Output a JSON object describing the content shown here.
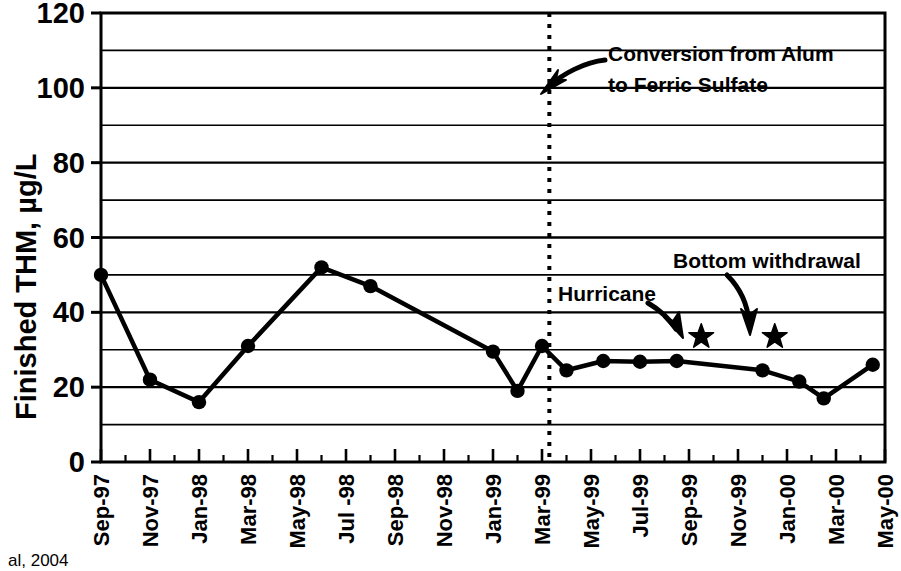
{
  "chart_data": {
    "type": "line",
    "title": "",
    "xlabel": "",
    "ylabel": "Finished THM, µg/L",
    "ylim": [
      0,
      120
    ],
    "y_ticks": [
      0,
      20,
      40,
      60,
      80,
      100,
      120
    ],
    "y_tick_labels": [
      "0",
      "20",
      "40",
      "60",
      "80",
      "100",
      "120"
    ],
    "y_minor_gridlines": [
      10,
      30,
      50,
      70,
      90,
      110
    ],
    "grid": true,
    "legend": "none",
    "x_tick_labels": [
      "Sep-97",
      "Nov-97",
      "Jan-98",
      "Mar-98",
      "May-98",
      "Jul -98",
      "Sep-98",
      "Nov-98",
      "Jan-99",
      "Mar-99",
      "May-99",
      "Jul-99",
      "Sep-99",
      "Nov-99",
      "Jan-00",
      "Mar-00",
      "May-00"
    ],
    "x_tick_months": [
      0,
      2,
      4,
      6,
      8,
      10,
      12,
      14,
      16,
      18,
      20,
      22,
      24,
      26,
      28,
      30,
      32
    ],
    "x_range_months": [
      0,
      32
    ],
    "series": [
      {
        "name": "Finished THM",
        "marker": "filled-circle",
        "points": [
          {
            "x_month": 0,
            "x_label": "Sep-97",
            "y": 50
          },
          {
            "x_month": 2,
            "x_label": "Nov-97",
            "y": 22
          },
          {
            "x_month": 4,
            "x_label": "Jan-98",
            "y": 16
          },
          {
            "x_month": 6,
            "x_label": "Mar-98",
            "y": 31
          },
          {
            "x_month": 9,
            "x_label": "Jun-98",
            "y": 52
          },
          {
            "x_month": 11,
            "x_label": "Aug-98",
            "y": 47
          },
          {
            "x_month": 16,
            "x_label": "Jan-99",
            "y": 29.5
          },
          {
            "x_month": 17,
            "x_label": "Feb-99",
            "y": 19
          },
          {
            "x_month": 18,
            "x_label": "Mar-99",
            "y": 31
          },
          {
            "x_month": 19,
            "x_label": "Apr-99",
            "y": 24.5
          },
          {
            "x_month": 20.5,
            "x_label": "May-99",
            "y": 27
          },
          {
            "x_month": 22,
            "x_label": "Jul-99",
            "y": 26.8
          },
          {
            "x_month": 23.5,
            "x_label": "Aug-99",
            "y": 27
          },
          {
            "x_month": 27,
            "x_label": "Dec-99",
            "y": 24.5
          },
          {
            "x_month": 28.5,
            "x_label": "Jan-00",
            "y": 21.5
          },
          {
            "x_month": 29.5,
            "x_label": "Feb-00",
            "y": 17
          },
          {
            "x_month": 31.5,
            "x_label": "Mar-00",
            "y": 26
          }
        ]
      }
    ],
    "star_markers": [
      {
        "x_month": 24.5,
        "y": 33.5,
        "label": "Hurricane"
      },
      {
        "x_month": 27.5,
        "y": 33.5,
        "label": "Bottom withdrawal"
      }
    ],
    "vertical_marker": {
      "x_month": 18.3,
      "style": "dotted",
      "label": "Conversion from Alum to Ferric Sulfate"
    },
    "annotations": [
      {
        "id": "conversion",
        "line1": "Conversion from Alum",
        "line2": "to Ferric Sulfate",
        "text_x": 608,
        "text_y": 61,
        "arrow_tip_x": 542,
        "arrow_tip_y": 93
      },
      {
        "id": "hurricane",
        "line1": "Hurricane",
        "line2": "",
        "text_x": 558,
        "text_y": 301,
        "arrow_tip_x": 681,
        "arrow_tip_y": 335
      },
      {
        "id": "bottom-withdrawal",
        "line1": "Bottom withdrawal",
        "line2": "",
        "text_x": 673,
        "text_y": 268,
        "arrow_tip_x": 749,
        "arrow_tip_y": 335
      }
    ],
    "colors": {
      "line": "#000000",
      "marker": "#000000",
      "grid": "#000000",
      "axis": "#000000",
      "background": "#ffffff"
    }
  },
  "credit": {
    "text": "al, 2004"
  }
}
